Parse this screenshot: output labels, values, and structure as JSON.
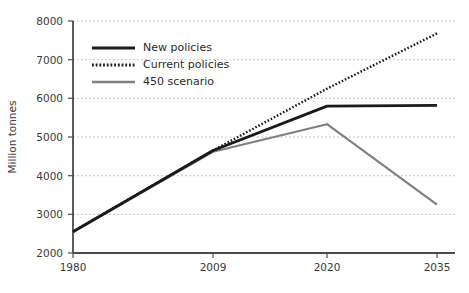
{
  "chart_data": {
    "type": "line",
    "title": "",
    "xlabel": "",
    "ylabel": "Million tonnes",
    "categories": [
      "1980",
      "2009",
      "2020",
      "2035"
    ],
    "xtick_labels": [
      "1980",
      "2009",
      "2020",
      "2035"
    ],
    "ytick_labels": [
      "2000",
      "3000",
      "4000",
      "5000",
      "6000",
      "7000",
      "8000"
    ],
    "ylim": [
      2000,
      8000
    ],
    "ytick_values": [
      2000,
      3000,
      4000,
      5000,
      6000,
      7000,
      8000
    ],
    "grid": true,
    "grid_style": "dashed",
    "legend_position": "upper-left-inside",
    "series": [
      {
        "name": "New policies",
        "style": "solid",
        "color": "#1a1a1a",
        "width": 2.6,
        "values": [
          2550,
          4650,
          5800,
          5820
        ]
      },
      {
        "name": "Current policies",
        "style": "dotted",
        "color": "#1a1a1a",
        "width": 2.4,
        "values": [
          2550,
          4650,
          6250,
          7680
        ]
      },
      {
        "name": "450 scenario",
        "style": "solid",
        "color": "#808080",
        "width": 2.2,
        "values": [
          2550,
          4620,
          5330,
          3250
        ]
      }
    ]
  },
  "legend": {
    "items": [
      {
        "label": "New policies"
      },
      {
        "label": "Current policies"
      },
      {
        "label": "450 scenario"
      }
    ]
  },
  "colors": {
    "axis": "#4a4a4a",
    "grid": "#c8c8c8",
    "text": "#3a3a3a",
    "series_dark": "#1a1a1a",
    "series_gray": "#808080",
    "background": "#ffffff"
  }
}
